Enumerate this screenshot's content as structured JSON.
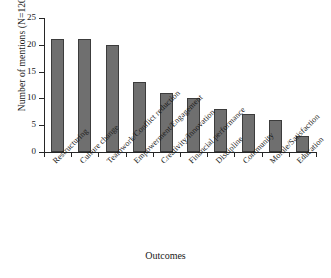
{
  "chart_data": {
    "type": "bar",
    "title": "",
    "xlabel": "Outcomes",
    "ylabel": "Number of mentions (N=120)",
    "categories": [
      "Restructuring",
      "Culture change",
      "Teamwork/Conflict reduction",
      "Empowerment/Engagement",
      "Creativity/Innovation",
      "Financial performance",
      "Discipline",
      "Community",
      "Morale/Satisfaction",
      "Education"
    ],
    "values": [
      21,
      21,
      20,
      13,
      11,
      10,
      8,
      7,
      6,
      3
    ],
    "ylim": [
      0,
      25
    ],
    "yticks": [
      0,
      5,
      10,
      15,
      20,
      25
    ],
    "ytick_labels": [
      "0",
      "5",
      "10",
      "15",
      "20",
      "25"
    ],
    "grid": false,
    "legend": null,
    "bar_color": "#6f6f6f",
    "bar_edge_color": "#3c3c3c",
    "axis_color": "#262626"
  }
}
